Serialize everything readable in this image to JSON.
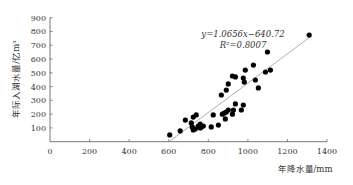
{
  "chart_data": {
    "type": "scatter",
    "title": "",
    "xlabel": "年降水量/mm",
    "ylabel": "年际入湖水量/亿m³",
    "xlim": [
      0,
      1400
    ],
    "ylim": [
      0,
      900
    ],
    "x_ticks": [
      0,
      200,
      400,
      600,
      800,
      1000,
      1200,
      1400
    ],
    "y_ticks": [
      100,
      200,
      300,
      400,
      500,
      600,
      700,
      800,
      900
    ],
    "x_tick_labels": [
      "0",
      "200",
      "400",
      "600",
      "800",
      "1000",
      "1200",
      "1400"
    ],
    "y_tick_labels": [
      "100",
      "200",
      "300",
      "400",
      "500",
      "600",
      "700",
      "800",
      "900"
    ],
    "grid": false,
    "legend": "none",
    "marker_color": "#000000",
    "trendline_color": "#999999",
    "trendline": {
      "slope": 1.0656,
      "intercept": -640.72,
      "x_range": [
        601,
        1310
      ]
    },
    "annotations": {
      "equation": "y=1.0656x−640.72",
      "r_squared": "R²=0.8007"
    },
    "series": [
      {
        "name": "observations",
        "points": [
          [
            605,
            49
          ],
          [
            658,
            78
          ],
          [
            684,
            157
          ],
          [
            714,
            136
          ],
          [
            724,
            179
          ],
          [
            739,
            194
          ],
          [
            719,
            107
          ],
          [
            734,
            92
          ],
          [
            724,
            85
          ],
          [
            749,
            114
          ],
          [
            759,
            128
          ],
          [
            765,
            107
          ],
          [
            775,
            114
          ],
          [
            759,
            100
          ],
          [
            815,
            107
          ],
          [
            825,
            194
          ],
          [
            871,
            200
          ],
          [
            881,
            208
          ],
          [
            891,
            215
          ],
          [
            901,
            230
          ],
          [
            937,
            274
          ],
          [
            922,
            200
          ],
          [
            927,
            230
          ],
          [
            851,
            121
          ],
          [
            886,
            165
          ],
          [
            866,
            339
          ],
          [
            891,
            375
          ],
          [
            901,
            419
          ],
          [
            922,
            477
          ],
          [
            937,
            470
          ],
          [
            977,
            462
          ],
          [
            982,
            433
          ],
          [
            987,
            520
          ],
          [
            1028,
            556
          ],
          [
            1038,
            448
          ],
          [
            1053,
            390
          ],
          [
            977,
            266
          ],
          [
            967,
            230
          ],
          [
            1089,
            506
          ],
          [
            1114,
            520
          ],
          [
            1099,
            651
          ],
          [
            1310,
            774
          ]
        ]
      }
    ]
  }
}
